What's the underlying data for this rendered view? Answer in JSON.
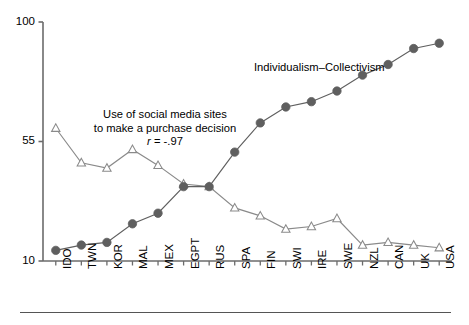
{
  "chart_data": {
    "type": "line",
    "title": "",
    "subtitle": "",
    "xlabel": "",
    "ylabel": "",
    "ylim": [
      10,
      100
    ],
    "yticks": [
      10,
      55,
      100
    ],
    "ytick_labels": [
      "10",
      "55",
      "100"
    ],
    "grid": false,
    "legend_position": "inline-annotation",
    "categories": [
      "IDO",
      "TWN",
      "KOR",
      "MAL",
      "MEX",
      "EGPT",
      "RUS",
      "SPA",
      "FIN",
      "SWI",
      "IRE",
      "SWE",
      "NZL",
      "CAN",
      "UK",
      "USA"
    ],
    "series": [
      {
        "name": "Individualism–Collectivism",
        "marker": "filled-circle",
        "color": "#5f5f5f",
        "values": [
          14,
          16,
          17,
          24,
          28,
          38,
          38,
          51,
          62,
          68,
          70,
          74,
          80,
          84,
          90,
          92
        ]
      },
      {
        "name": "Use of social media sites to make a purchase decision",
        "marker": "open-triangle",
        "color": "#8a8a8a",
        "values": [
          60,
          47,
          45,
          52,
          46,
          39,
          38,
          30,
          27,
          22,
          23,
          26,
          16,
          17,
          16,
          15
        ]
      }
    ],
    "annotations": [
      {
        "id": "social-media-annotation",
        "lines": [
          "Use of social media sites",
          "to make a purchase decision"
        ],
        "stat_label": "r",
        "stat_value": " = -.97",
        "x": 165,
        "y": 108
      },
      {
        "id": "individualism-label",
        "text": "Individualism–Collectivism",
        "x": 254,
        "y": 61
      }
    ]
  },
  "axis": {
    "y_tick_100": "100",
    "y_tick_55": "55",
    "y_tick_10": "10"
  },
  "colors": {
    "axis": "#6b6b6b",
    "circle_series": "#5f5f5f",
    "triangle_series": "#8a8a8a",
    "text": "#000000",
    "rule": "#555555"
  }
}
